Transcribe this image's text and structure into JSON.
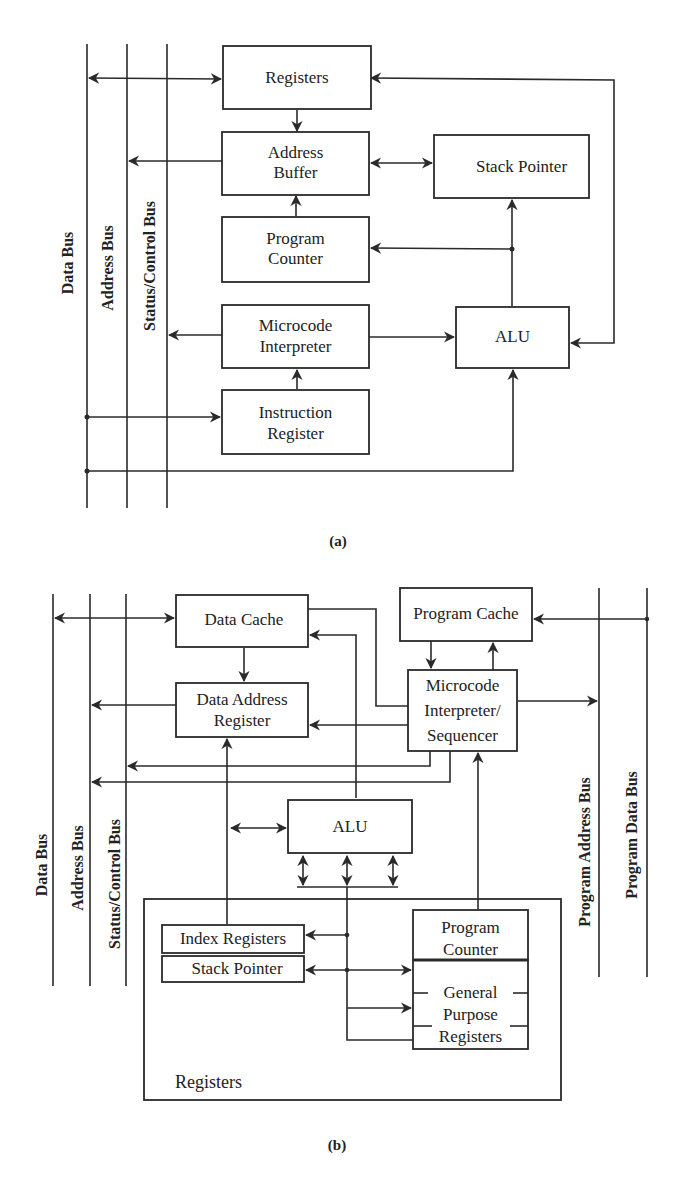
{
  "diagram_a": {
    "caption": "(a)",
    "buses": {
      "data": "Data Bus",
      "address": "Address Bus",
      "status_control": "Status/Control Bus"
    },
    "blocks": {
      "registers": "Registers",
      "address_buffer_1": "Address",
      "address_buffer_2": "Buffer",
      "stack_pointer": "Stack Pointer",
      "program_counter_1": "Program",
      "program_counter_2": "Counter",
      "microcode_1": "Microcode",
      "microcode_2": "Interpreter",
      "alu": "ALU",
      "instruction_register_1": "Instruction",
      "instruction_register_2": "Register"
    }
  },
  "diagram_b": {
    "caption": "(b)",
    "buses": {
      "data": "Data Bus",
      "address": "Address Bus",
      "status_control": "Status/Control Bus",
      "program_address": "Program Address Bus",
      "program_data": "Program Data Bus"
    },
    "blocks": {
      "data_cache": "Data Cache",
      "program_cache": "Program Cache",
      "data_address_register_1": "Data Address",
      "data_address_register_2": "Register",
      "microcode_1": "Microcode",
      "microcode_2": "Interpreter/",
      "microcode_3": "Sequencer",
      "alu": "ALU",
      "index_registers": "Index Registers",
      "stack_pointer": "Stack Pointer",
      "program_counter_1": "Program",
      "program_counter_2": "Counter",
      "gpr_1": "General",
      "gpr_2": "Purpose",
      "gpr_3": "Registers",
      "registers_group": "Registers"
    }
  }
}
